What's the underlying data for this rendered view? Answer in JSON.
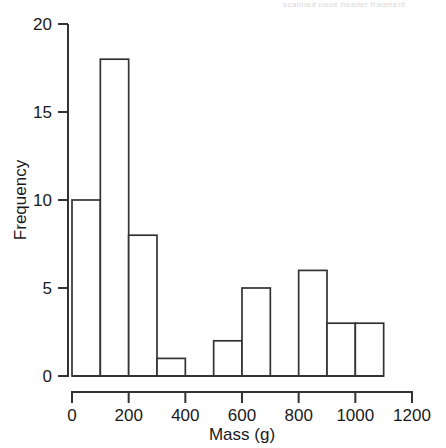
{
  "figure": {
    "top_artifact_text": "scanned page header fragment",
    "background_color": "#ffffff",
    "line_color": "#333333",
    "bar_fill_color": "#ffffff"
  },
  "chart_data": {
    "type": "bar",
    "title": "",
    "subtitle": "",
    "xlabel": "Mass (g)",
    "ylabel": "Frequency",
    "bin_width": 100,
    "bin_starts": [
      0,
      100,
      200,
      300,
      400,
      500,
      600,
      700,
      800,
      900,
      1000
    ],
    "bin_ends": [
      100,
      200,
      300,
      400,
      500,
      600,
      700,
      800,
      900,
      1000,
      1100
    ],
    "categories": [
      "0-100",
      "100-200",
      "200-300",
      "300-400",
      "400-500",
      "500-600",
      "600-700",
      "700-800",
      "800-900",
      "900-1000",
      "1000-1100"
    ],
    "values": [
      10,
      18,
      8,
      1,
      0,
      2,
      5,
      0,
      6,
      3,
      3
    ],
    "xlim": [
      0,
      1200
    ],
    "ylim": [
      0,
      20
    ],
    "xticks": [
      0,
      200,
      400,
      600,
      800,
      1000,
      1200
    ],
    "xtick_labels": [
      "0",
      "200",
      "400",
      "600",
      "800",
      "1000",
      "1200"
    ],
    "yticks": [
      0,
      5,
      10,
      15,
      20
    ],
    "ytick_labels": [
      "0",
      "5",
      "10",
      "15",
      "20"
    ],
    "grid": false,
    "legend": null,
    "legend_position": "none",
    "annotations": []
  }
}
